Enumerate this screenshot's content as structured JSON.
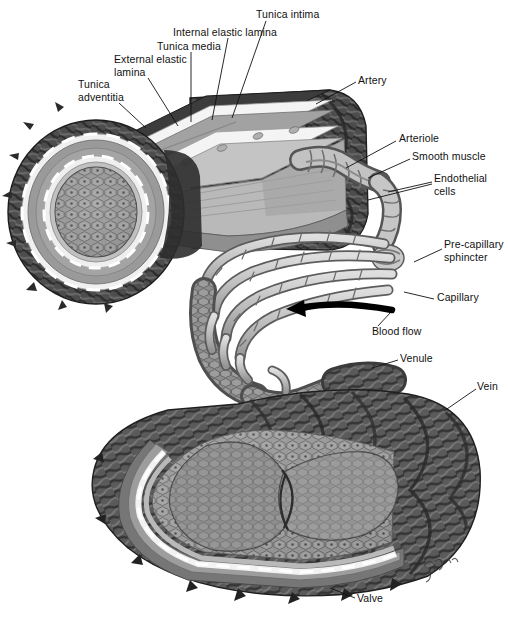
{
  "figure": {
    "width": 508,
    "height": 626,
    "signature": "Fiona"
  },
  "palette": {
    "background": "#ffffff",
    "ink": "#111111",
    "adventitia_dark": "#2b2b2b",
    "adventitia_mid": "#4a4a4a",
    "media_gray": "#8e8e8e",
    "media_light": "#a8a8a8",
    "elastic_lamina": "#f2f2f2",
    "intima_gray": "#bdbdbd",
    "lumen_gray": "#9a9a9a",
    "lumen_dark": "#6f6f6f",
    "capillary_light": "#c9c9c9",
    "capillary_outline": "#5a5a5a",
    "muscle_dark": "#3a3a3a",
    "muscle_mid": "#6a6a6a",
    "arrow": "#000000"
  },
  "labels": [
    {
      "id": "tunica-adventitia",
      "text": "Tunica\nadventitia",
      "x": 78,
      "y": 78,
      "align": "left",
      "leaders": [
        [
          119,
          103,
          146,
          128
        ]
      ]
    },
    {
      "id": "external-elastic-lamina",
      "text": "External elastic\nlamina",
      "x": 114,
      "y": 53,
      "align": "left",
      "leaders": [
        [
          148,
          78,
          178,
          126
        ]
      ]
    },
    {
      "id": "tunica-media",
      "text": "Tunica media",
      "x": 157,
      "y": 40,
      "align": "left",
      "leaders": [
        [
          191,
          52,
          191,
          122
        ]
      ]
    },
    {
      "id": "internal-elastic-lamina",
      "text": "Internal elastic lamina",
      "x": 173,
      "y": 26,
      "align": "left",
      "leaders": [
        [
          228,
          38,
          212,
          120
        ]
      ]
    },
    {
      "id": "tunica-intima",
      "text": "Tunica intima",
      "x": 256,
      "y": 8,
      "align": "left",
      "leaders": [
        [
          266,
          21,
          232,
          118
        ]
      ]
    },
    {
      "id": "artery",
      "text": "Artery",
      "x": 358,
      "y": 74,
      "align": "left",
      "leaders": [
        [
          356,
          82,
          316,
          104
        ]
      ]
    },
    {
      "id": "arteriole",
      "text": "Arteriole",
      "x": 399,
      "y": 132,
      "align": "left",
      "leaders": [
        [
          396,
          141,
          346,
          168
        ]
      ]
    },
    {
      "id": "smooth-muscle",
      "text": "Smooth muscle",
      "x": 412,
      "y": 150,
      "align": "left",
      "leaders": [
        [
          410,
          159,
          368,
          178
        ]
      ]
    },
    {
      "id": "endothelial-cells",
      "text": "Endothelial\ncells",
      "x": 434,
      "y": 172,
      "align": "left",
      "leaders": [
        [
          432,
          182,
          388,
          192
        ],
        [
          432,
          184,
          368,
          200
        ]
      ]
    },
    {
      "id": "pre-capillary-sphincter",
      "text": "Pre-capillary\nsphincter",
      "x": 444,
      "y": 238,
      "align": "left",
      "leaders": [
        [
          442,
          249,
          414,
          262
        ]
      ]
    },
    {
      "id": "capillary",
      "text": "Capillary",
      "x": 437,
      "y": 291,
      "align": "left",
      "leaders": [
        [
          434,
          299,
          404,
          292
        ]
      ]
    },
    {
      "id": "blood-flow",
      "text": "Blood flow",
      "x": 372,
      "y": 325,
      "align": "left",
      "leaders": [
        [
          378,
          326,
          390,
          313
        ]
      ]
    },
    {
      "id": "venule",
      "text": "Venule",
      "x": 400,
      "y": 352,
      "align": "left",
      "leaders": [
        [
          398,
          360,
          372,
          368
        ]
      ]
    },
    {
      "id": "vein",
      "text": "Vein",
      "x": 477,
      "y": 380,
      "align": "left",
      "leaders": [
        [
          476,
          389,
          444,
          411
        ]
      ]
    },
    {
      "id": "valve",
      "text": "Valve",
      "x": 357,
      "y": 592,
      "align": "left",
      "leaders": [
        [
          355,
          598,
          330,
          588
        ]
      ]
    }
  ],
  "structures": [
    {
      "id": "artery-cross-section",
      "name": "Artery cut-away with lumen and wall layers"
    },
    {
      "id": "arteriole-branch",
      "name": "Arteriole branching from artery"
    },
    {
      "id": "capillary-bed",
      "name": "Capillary bed network"
    },
    {
      "id": "venule-branch",
      "name": "Venule draining the capillary bed"
    },
    {
      "id": "vein-cross-section",
      "name": "Vein cut-away showing valve cusps"
    },
    {
      "id": "blood-flow-arrow",
      "name": "Directional arrow indicating blood flow"
    }
  ]
}
